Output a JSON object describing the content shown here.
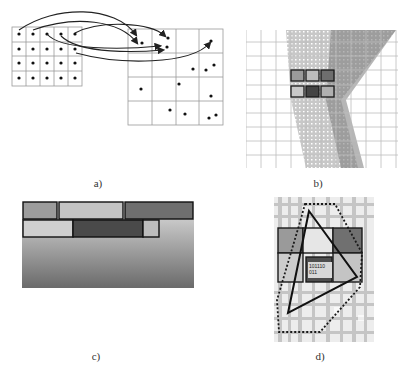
{
  "figure": {
    "panels": [
      {
        "id": "a",
        "caption": "a)",
        "description": "Regular source grid of points mapped via arrows to scattered points in an irregular target grid"
      },
      {
        "id": "b",
        "caption": "b)",
        "description": "Dense point-cloud/raster texture over a grid with six highlighted cells (2 rows x 3)"
      },
      {
        "id": "c",
        "caption": "c)",
        "description": "Two rows of shaded rectangular blocks over a vertical gray gradient"
      },
      {
        "id": "d",
        "caption": "d)",
        "description": "Textured raster with six shaded cells, a triangle outline, and a dotted polygon outline; center cell labeled with binary code"
      }
    ],
    "panel_a": {
      "source_grid": {
        "cols": 5,
        "rows": 4
      },
      "target_grid": {
        "cols": 4,
        "rows": 4
      },
      "arrow_count": 6
    },
    "panel_b": {
      "highlight_cells": [
        {
          "row": 0,
          "col": 0,
          "fill": "#9a9a9a"
        },
        {
          "row": 0,
          "col": 1,
          "fill": "#bdbdbd"
        },
        {
          "row": 0,
          "col": 2,
          "fill": "#6e6e6e"
        },
        {
          "row": 1,
          "col": 0,
          "fill": "#c8c8c8"
        },
        {
          "row": 1,
          "col": 1,
          "fill": "#444444"
        },
        {
          "row": 1,
          "col": 2,
          "fill": "#b0b0b0"
        }
      ]
    },
    "panel_c": {
      "top_row": [
        {
          "fill": "#9c9c9c"
        },
        {
          "fill": "#c4c4c4"
        },
        {
          "fill": "#6f6f6f"
        }
      ],
      "bottom_row": [
        {
          "fill": "#cfcfcf"
        },
        {
          "fill": "#4a4a4a"
        },
        {
          "fill": "#bdbdbd"
        }
      ],
      "gradient": {
        "top": "#c9c9c9",
        "bottom": "#6a6a6a"
      }
    },
    "panel_d": {
      "center_label_line1": "101110",
      "center_label_line2": "011",
      "cell_fills": [
        "#9a9a9a",
        "#e6e6e6",
        "#707070",
        "#cccccc",
        "#4e4e4e",
        "#c4c4c4"
      ]
    }
  }
}
